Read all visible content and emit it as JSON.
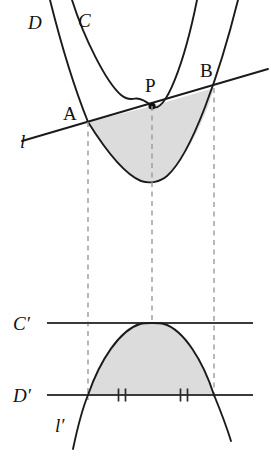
{
  "figure": {
    "background_color": "#ffffff",
    "shade_color": "#dcdcdc",
    "curve_color": "#1b1b1b",
    "dash_color": "#9a9a9a",
    "axis_color": "#3a3a3a"
  },
  "labels": {
    "curve_D": "D",
    "curve_C": "C",
    "point_A": "A",
    "point_P": "P",
    "point_B": "B",
    "line_l": "l",
    "curve_C_prime": "C′",
    "curve_D_prime": "D′",
    "line_l_prime": "l′"
  },
  "points": {
    "A": {
      "x": 88,
      "y": 122
    },
    "P": {
      "x": 152,
      "y": 106
    },
    "B": {
      "x": 214,
      "y": 88
    }
  },
  "label_positions": {
    "curve_D": {
      "x": 28,
      "y": 29
    },
    "curve_C": {
      "x": 78,
      "y": 27
    },
    "point_A": {
      "x": 63,
      "y": 120
    },
    "point_P": {
      "x": 145,
      "y": 92
    },
    "point_B": {
      "x": 200,
      "y": 77
    },
    "line_l": {
      "x": 20,
      "y": 148
    },
    "curve_C_prime": {
      "x": 13,
      "y": 330
    },
    "curve_D_prime": {
      "x": 13,
      "y": 402
    },
    "line_l_prime": {
      "x": 55,
      "y": 432
    }
  },
  "upper_panel": {
    "curve_C": {
      "description": "narrow upward parabola, tangent to line l at P",
      "vertex": {
        "x": 133,
        "y": 98
      },
      "left_top": {
        "x": 72,
        "y": 0
      },
      "right_top": {
        "x": 197,
        "y": 0
      }
    },
    "curve_D": {
      "description": "wide upward parabola through A and B, shaded region boundary",
      "vertex": {
        "x": 144,
        "y": 181
      },
      "left_top": {
        "x": 50,
        "y": 0
      },
      "right_top": {
        "x": 238,
        "y": 0
      }
    },
    "line_l": {
      "description": "secant of D through A, P, B; tangent to C at P",
      "start": {
        "x": 22,
        "y": 141
      },
      "end": {
        "x": 268,
        "y": 69
      }
    },
    "shaded_region": "region between chord AB of line l and the arc of parabola D"
  },
  "lower_panel": {
    "line_C_prime": {
      "y": 323,
      "x_start": 47,
      "x_end": 253
    },
    "line_D_prime": {
      "y": 395,
      "x_start": 47,
      "x_end": 253
    },
    "curve_l_prime": {
      "description": "downward parabola, vertex touching C′, crossing D′ at the two outer drop lines",
      "vertex": {
        "x": 152,
        "y": 323
      },
      "left_end": {
        "x": 73,
        "y": 449
      },
      "right_end": {
        "x": 231,
        "y": 441
      }
    },
    "shaded_region": "region between line D′ and the arc of parabola l′",
    "tick_marks": {
      "description": "double hash marks indicating equal segments on D′",
      "left": {
        "x": 122,
        "y": 394
      },
      "right": {
        "x": 184,
        "y": 394
      },
      "pair_offset": 3.5,
      "half_height": 6.5
    }
  },
  "drop_lines": [
    {
      "name": "drop-line-A",
      "x": 88,
      "y_start": 122,
      "y_end": 400
    },
    {
      "name": "drop-line-P",
      "x": 152,
      "y_start": 106,
      "y_end": 400
    },
    {
      "name": "drop-line-B",
      "x": 214,
      "y_start": 88,
      "y_end": 400
    }
  ]
}
